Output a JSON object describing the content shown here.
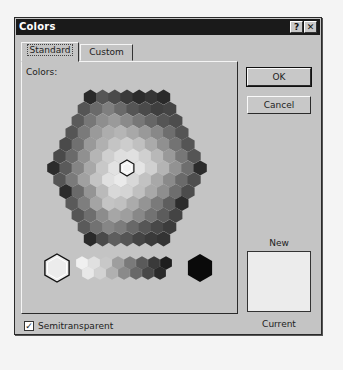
{
  "dialog": {
    "title": "Colors",
    "help_button": "?",
    "close_button": "✕"
  },
  "tabs": [
    {
      "label": "Standard",
      "active": true
    },
    {
      "label": "Custom",
      "active": false
    }
  ],
  "panel": {
    "colors_label": "Colors:",
    "honeycomb": {
      "hex_radius": 7,
      "center": [
        127,
        168
      ],
      "row_spacing": 11.8,
      "col_spacing": 12.2,
      "rows": [
        [
          "#2a2a2a",
          "#555",
          "#4a4a4a",
          "#3a3a3a",
          "#2c2c2c",
          "#353535",
          "#2a2a2a"
        ],
        [
          "#555",
          "#6a6a6a",
          "#7f7f7f",
          "#6a6a6a",
          "#555",
          "#4a4a4a",
          "#3f3f3f",
          "#444"
        ],
        [
          "#5a5a5a",
          "#777",
          "#8e8e8e",
          "#9a9a9a",
          "#8a8a8a",
          "#777",
          "#666",
          "#555",
          "#4d4d4d"
        ],
        [
          "#555",
          "#7a7a7a",
          "#9a9a9a",
          "#adadad",
          "#b5b5b5",
          "#a8a8a8",
          "#999",
          "#888",
          "#6e6e6e",
          "#555"
        ],
        [
          "#4a4a4a",
          "#707070",
          "#999",
          "#b0b0b0",
          "#c4c4c4",
          "#cdcdcd",
          "#c0c0c0",
          "#aaa",
          "#909090",
          "#737373",
          "#555"
        ],
        [
          "#4a4a4a",
          "#6a6a6a",
          "#909090",
          "#b5b5b5",
          "#cfcfcf",
          "#dedede",
          "#e0e0e0",
          "#d0d0d0",
          "#b8b8b8",
          "#999",
          "#777",
          "#555"
        ],
        [
          "#2c2c2c",
          "#5a5a5a",
          "#848484",
          "#a8a8a8",
          "#c8c8c8",
          "#e2e2e2",
          "#f2f2f2",
          "#e4e4e4",
          "#d0d0d0",
          "#b4b4b4",
          "#929292",
          "#6e6e6e",
          "#2c2c2c"
        ],
        [
          "#555",
          "#7a7a7a",
          "#a0a0a0",
          "#c4c4c4",
          "#e0e0e0",
          "#eaeaea",
          "#d8d8d8",
          "#c2c2c2",
          "#a8a8a8",
          "#8a8a8a",
          "#6a6a6a",
          "#4e4e4e"
        ],
        [
          "#2c2c2c",
          "#6a6a6a",
          "#949494",
          "#bababa",
          "#d8d8d8",
          "#d4d4d4",
          "#c0c0c0",
          "#a8a8a8",
          "#8e8e8e",
          "#6e6e6e",
          "#4c4c4c"
        ],
        [
          "#5a5a5a",
          "#7e7e7e",
          "#a4a4a4",
          "#c4c4c4",
          "#c0c0c0",
          "#ababab",
          "#949494",
          "#7a7a7a",
          "#5e5e5e",
          "#2c2c2c"
        ],
        [
          "#555",
          "#6e6e6e",
          "#8c8c8c",
          "#a6a6a6",
          "#9e9e9e",
          "#888",
          "#727272",
          "#5c5c5c",
          "#444"
        ],
        [
          "#5a5a5a",
          "#727272",
          "#868686",
          "#7c7c7c",
          "#686868",
          "#565656",
          "#484848",
          "#3c3c3c"
        ],
        [
          "#2a2a2a",
          "#4a4a4a",
          "#5e5e5e",
          "#555",
          "#444",
          "#3a3a3a",
          "#333"
        ]
      ],
      "selected": {
        "row": 6,
        "col": 6
      }
    },
    "grayscale": {
      "large_white": "#ececec",
      "large_black": "#0a0a0a",
      "strip": [
        [
          "#f0f0f0",
          "#e0e0e0",
          "#c8c8c8",
          "#9e9e9e",
          "#7a7a7a",
          "#5a5a5a",
          "#3a3a3a",
          "#1e1e1e"
        ],
        [
          "#e8e8e8",
          "#d2d2d2",
          "#b0b0b0",
          "#8a8a8a",
          "#686868",
          "#484848",
          "#2a2a2a"
        ]
      ]
    }
  },
  "buttons": {
    "ok": "OK",
    "cancel": "Cancel"
  },
  "preview": {
    "new_label": "New",
    "current_label": "Current",
    "new_color": "#ececec"
  },
  "checkbox": {
    "label": "Semitransparent",
    "checked": true,
    "mark": "✓"
  }
}
